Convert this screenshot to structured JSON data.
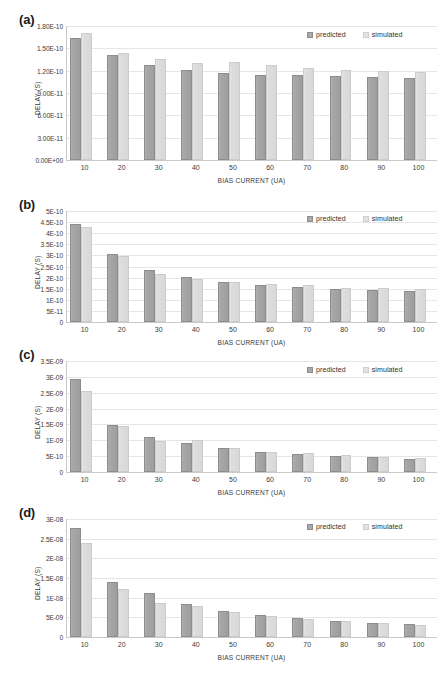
{
  "figure": {
    "width": 443,
    "height": 693,
    "legend": {
      "predicted_label": "predicted",
      "simulated_label": "simulated",
      "predicted_color": "#a9a9a9",
      "simulated_color": "#e2e2e2"
    },
    "axis_titles": {
      "x": "BIAS CURRENT (UA)",
      "y": "DELAY (S)"
    }
  },
  "panels": [
    {
      "label": "(a)",
      "yticks": [
        "0.00E+00",
        "3.00E-11",
        "6.00E-11",
        "9.00E-11",
        "1.20E-10",
        "1.50E-10",
        "1.80E-10"
      ],
      "chart_data": {
        "type": "bar",
        "title": "",
        "xlabel": "BIAS CURRENT (UA)",
        "ylabel": "DELAY (S)",
        "categories": [
          "10",
          "20",
          "30",
          "40",
          "50",
          "60",
          "70",
          "80",
          "90",
          "100"
        ],
        "ylim": [
          0,
          1.8e-10
        ],
        "ytick_values": [
          0,
          3e-11,
          6e-11,
          9e-11,
          1.2e-10,
          1.5e-10,
          1.8e-10
        ],
        "grid": true,
        "legend_position": "top-right",
        "series": [
          {
            "name": "predicted",
            "values": [
              1.635e-10,
              1.405e-10,
              1.275e-10,
              1.205e-10,
              1.172e-10,
              1.148e-10,
              1.136e-10,
              1.124e-10,
              1.118e-10,
              1.102e-10
            ]
          },
          {
            "name": "simulated",
            "values": [
              1.7e-10,
              1.432e-10,
              1.352e-10,
              1.305e-10,
              1.312e-10,
              1.272e-10,
              1.242e-10,
              1.208e-10,
              1.192e-10,
              1.185e-10
            ]
          }
        ]
      }
    },
    {
      "label": "(b)",
      "yticks": [
        "0",
        "5E-11",
        "1E-10",
        "1.5E-10",
        "2E-10",
        "2.5E-10",
        "3E-10",
        "3.5E-10",
        "4E-10",
        "4.5E-10",
        "5E-10"
      ],
      "chart_data": {
        "type": "bar",
        "title": "",
        "xlabel": "BIAS CURRENT (UA)",
        "ylabel": "DELAY (S)",
        "categories": [
          "10",
          "20",
          "30",
          "40",
          "50",
          "60",
          "70",
          "80",
          "90",
          "100"
        ],
        "ylim": [
          0,
          5e-10
        ],
        "ytick_values": [
          0,
          5e-11,
          1e-10,
          1.5e-10,
          2e-10,
          2.5e-10,
          3e-10,
          3.5e-10,
          4e-10,
          4.5e-10,
          5e-10
        ],
        "grid": true,
        "legend_position": "top-right",
        "series": [
          {
            "name": "predicted",
            "values": [
              4.43e-10,
              3.05e-10,
              2.35e-10,
              2.02e-10,
              1.81e-10,
              1.67e-10,
              1.57e-10,
              1.49e-10,
              1.45e-10,
              1.39e-10
            ]
          },
          {
            "name": "simulated",
            "values": [
              4.28e-10,
              2.97e-10,
              2.18e-10,
              1.92e-10,
              1.79e-10,
              1.71e-10,
              1.65e-10,
              1.55e-10,
              1.52e-10,
              1.48e-10
            ]
          }
        ]
      }
    },
    {
      "label": "(c)",
      "yticks": [
        "0",
        "5E-10",
        "1E-09",
        "1.5E-09",
        "2E-09",
        "2.5E-09",
        "3E-09",
        "3.5E-09"
      ],
      "chart_data": {
        "type": "bar",
        "title": "",
        "xlabel": "BIAS CURRENT (UA)",
        "ylabel": "DELAY (S)",
        "categories": [
          "10",
          "20",
          "30",
          "40",
          "50",
          "60",
          "70",
          "80",
          "90",
          "100"
        ],
        "ylim": [
          0,
          3.5e-09
        ],
        "ytick_values": [
          0,
          5e-10,
          1e-09,
          1.5e-09,
          2e-09,
          2.5e-09,
          3e-09,
          3.5e-09
        ],
        "grid": true,
        "legend_position": "top-right",
        "series": [
          {
            "name": "predicted",
            "values": [
              2.94e-09,
              1.49e-09,
              1.11e-09,
              9.25e-10,
              7.55e-10,
              6.4e-10,
              5.6e-10,
              5.05e-10,
              4.6e-10,
              4.05e-10
            ]
          },
          {
            "name": "simulated",
            "values": [
              2.56e-09,
              1.46e-09,
              9.8e-10,
              9.95e-10,
              7.5e-10,
              6.35e-10,
              5.9e-10,
              5.35e-10,
              4.85e-10,
              4.4e-10
            ]
          }
        ]
      }
    },
    {
      "label": "(d)",
      "yticks": [
        "0",
        "5E-09",
        "1E-08",
        "1.5E-08",
        "2E-08",
        "2.5E-08",
        "3E-08"
      ],
      "chart_data": {
        "type": "bar",
        "title": "",
        "xlabel": "BIAS CURRENT (UA)",
        "ylabel": "DELAY (S)",
        "categories": [
          "10",
          "20",
          "30",
          "40",
          "50",
          "60",
          "70",
          "80",
          "90",
          "100"
        ],
        "ylim": [
          0,
          3e-08
        ],
        "ytick_values": [
          0,
          5e-09,
          1e-08,
          1.5e-08,
          2e-08,
          2.5e-08,
          3e-08
        ],
        "grid": true,
        "legend_position": "top-right",
        "series": [
          {
            "name": "predicted",
            "values": [
              2.78e-08,
              1.39e-08,
              1.11e-08,
              8.3e-09,
              6.7e-09,
              5.5e-09,
              4.8e-09,
              4.15e-09,
              3.6e-09,
              3.2e-09
            ]
          },
          {
            "name": "simulated",
            "values": [
              2.4e-08,
              1.23e-08,
              8.6e-09,
              7.8e-09,
              6.45e-09,
              5.25e-09,
              4.6e-09,
              4.05e-09,
              3.45e-09,
              3.1e-09
            ]
          }
        ]
      }
    }
  ]
}
